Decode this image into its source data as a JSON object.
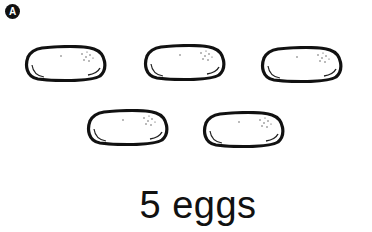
{
  "badge": {
    "label": "A"
  },
  "eggs": [
    {
      "id": 1,
      "x": 24,
      "y": 45
    },
    {
      "id": 2,
      "x": 143,
      "y": 44
    },
    {
      "id": 3,
      "x": 260,
      "y": 46
    },
    {
      "id": 4,
      "x": 86,
      "y": 109
    },
    {
      "id": 5,
      "x": 202,
      "y": 111
    }
  ],
  "caption": {
    "text": "5 eggs"
  },
  "colors": {
    "outline": "#111111",
    "background": "#ffffff"
  }
}
